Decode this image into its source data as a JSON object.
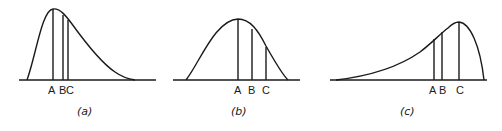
{
  "panels": [
    {
      "id": "a",
      "caption": "(a)",
      "shape": "right-skewed",
      "labels": {
        "A": "A",
        "B": "B",
        "C": "C"
      },
      "label_text": "A BC"
    },
    {
      "id": "b",
      "caption": "(b)",
      "shape": "slightly right-skewed",
      "labels": {
        "A": "A",
        "B": "B",
        "C": "C"
      }
    },
    {
      "id": "c",
      "caption": "(c)",
      "shape": "left-skewed",
      "labels": {
        "A": "A",
        "B": "B",
        "C": "C"
      }
    }
  ],
  "colors": {
    "ink": "#1a1a1a",
    "background": "#ffffff"
  }
}
